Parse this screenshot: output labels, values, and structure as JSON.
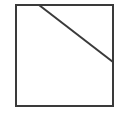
{
  "diagram": {
    "canvas": {
      "width": 119,
      "height": 114,
      "background": "#ffffff"
    },
    "stroke_color": "#3a3a3a",
    "stroke_width": 2,
    "square": {
      "x": 16,
      "y": 5,
      "width": 97,
      "height": 101
    },
    "cut_line": {
      "x1": 39,
      "y1": 5,
      "x2": 113,
      "y2": 62
    }
  }
}
